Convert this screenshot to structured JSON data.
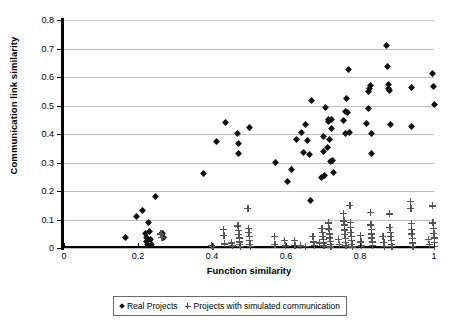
{
  "chart_data": {
    "type": "scatter",
    "title": "",
    "xlabel": "Function similarity",
    "ylabel": "Communication link similarity",
    "xlim": [
      0,
      1
    ],
    "ylim": [
      0,
      0.8
    ],
    "xticks": [
      "0",
      "0.2",
      "0.4",
      "0.6",
      "0.8",
      "1"
    ],
    "xtick_values": [
      0,
      0.2,
      0.4,
      0.6,
      0.8,
      1
    ],
    "yticks": [
      "0",
      "0.1",
      "0.2",
      "0.3",
      "0.4",
      "0.5",
      "0.6",
      "0.7",
      "0.8"
    ],
    "ytick_values": [
      0,
      0.1,
      0.2,
      0.3,
      0.4,
      0.5,
      0.6,
      0.7,
      0.8
    ],
    "grid": "horizontal",
    "legend_position": "bottom",
    "series": [
      {
        "name": "Real Projects",
        "marker": "diamond",
        "color": "#111111",
        "points": [
          [
            0.165,
            0.038
          ],
          [
            0.197,
            0.112
          ],
          [
            0.213,
            0.131
          ],
          [
            0.22,
            0.05
          ],
          [
            0.222,
            0.038
          ],
          [
            0.224,
            0.024
          ],
          [
            0.226,
            0.012
          ],
          [
            0.228,
            0.091
          ],
          [
            0.232,
            0.058
          ],
          [
            0.234,
            0.03
          ],
          [
            0.236,
            0.014
          ],
          [
            0.247,
            0.18
          ],
          [
            0.263,
            0.052
          ],
          [
            0.267,
            0.05
          ],
          [
            0.268,
            0.038
          ],
          [
            0.378,
            0.262
          ],
          [
            0.412,
            0.372
          ],
          [
            0.437,
            0.442
          ],
          [
            0.47,
            0.403
          ],
          [
            0.471,
            0.365
          ],
          [
            0.472,
            0.331
          ],
          [
            0.5,
            0.423
          ],
          [
            0.571,
            0.299
          ],
          [
            0.604,
            0.233
          ],
          [
            0.616,
            0.275
          ],
          [
            0.628,
            0.381
          ],
          [
            0.641,
            0.405
          ],
          [
            0.646,
            0.336
          ],
          [
            0.652,
            0.433
          ],
          [
            0.657,
            0.378
          ],
          [
            0.663,
            0.327
          ],
          [
            0.667,
            0.165
          ],
          [
            0.668,
            0.519
          ],
          [
            0.697,
            0.247
          ],
          [
            0.7,
            0.338
          ],
          [
            0.701,
            0.39
          ],
          [
            0.703,
            0.255
          ],
          [
            0.706,
            0.494
          ],
          [
            0.712,
            0.354
          ],
          [
            0.714,
            0.443
          ],
          [
            0.716,
            0.45
          ],
          [
            0.718,
            0.379
          ],
          [
            0.72,
            0.305
          ],
          [
            0.722,
            0.452
          ],
          [
            0.724,
            0.419
          ],
          [
            0.726,
            0.307
          ],
          [
            0.728,
            0.265
          ],
          [
            0.755,
            0.447
          ],
          [
            0.76,
            0.48
          ],
          [
            0.762,
            0.401
          ],
          [
            0.764,
            0.523
          ],
          [
            0.766,
            0.475
          ],
          [
            0.77,
            0.628
          ],
          [
            0.772,
            0.404
          ],
          [
            0.818,
            0.437
          ],
          [
            0.822,
            0.49
          ],
          [
            0.824,
            0.548
          ],
          [
            0.826,
            0.561
          ],
          [
            0.828,
            0.571
          ],
          [
            0.83,
            0.402
          ],
          [
            0.832,
            0.33
          ],
          [
            0.872,
            0.709
          ],
          [
            0.874,
            0.637
          ],
          [
            0.876,
            0.575
          ],
          [
            0.878,
            0.56
          ],
          [
            0.88,
            0.551
          ],
          [
            0.882,
            0.432
          ],
          [
            0.938,
            0.564
          ],
          [
            0.94,
            0.428
          ],
          [
            0.997,
            0.612
          ],
          [
            0.999,
            0.565
          ],
          [
            1.0,
            0.503
          ]
        ]
      },
      {
        "name": "Projects with simulated communication",
        "marker": "plus",
        "color": "#555555",
        "points": [
          [
            0.262,
            0.05
          ],
          [
            0.264,
            0.038
          ],
          [
            0.398,
            0.01
          ],
          [
            0.402,
            0.005
          ],
          [
            0.43,
            0.066
          ],
          [
            0.432,
            0.044
          ],
          [
            0.434,
            0.015
          ],
          [
            0.452,
            0.018
          ],
          [
            0.455,
            0.008
          ],
          [
            0.47,
            0.078
          ],
          [
            0.471,
            0.062
          ],
          [
            0.472,
            0.048
          ],
          [
            0.473,
            0.036
          ],
          [
            0.474,
            0.022
          ],
          [
            0.475,
            0.012
          ],
          [
            0.476,
            0.005
          ],
          [
            0.497,
            0.14
          ],
          [
            0.498,
            0.07
          ],
          [
            0.499,
            0.055
          ],
          [
            0.5,
            0.04
          ],
          [
            0.501,
            0.026
          ],
          [
            0.502,
            0.014
          ],
          [
            0.503,
            0.006
          ],
          [
            0.568,
            0.04
          ],
          [
            0.57,
            0.012
          ],
          [
            0.596,
            0.026
          ],
          [
            0.598,
            0.008
          ],
          [
            0.622,
            0.028
          ],
          [
            0.624,
            0.01
          ],
          [
            0.638,
            0.008
          ],
          [
            0.652,
            0.006
          ],
          [
            0.672,
            0.04
          ],
          [
            0.674,
            0.022
          ],
          [
            0.676,
            0.01
          ],
          [
            0.69,
            0.018
          ],
          [
            0.697,
            0.07
          ],
          [
            0.698,
            0.055
          ],
          [
            0.699,
            0.042
          ],
          [
            0.7,
            0.03
          ],
          [
            0.701,
            0.018
          ],
          [
            0.702,
            0.008
          ],
          [
            0.715,
            0.088
          ],
          [
            0.716,
            0.068
          ],
          [
            0.717,
            0.05
          ],
          [
            0.718,
            0.036
          ],
          [
            0.719,
            0.024
          ],
          [
            0.72,
            0.012
          ],
          [
            0.721,
            0.004
          ],
          [
            0.742,
            0.03
          ],
          [
            0.744,
            0.014
          ],
          [
            0.755,
            0.122
          ],
          [
            0.756,
            0.096
          ],
          [
            0.757,
            0.082
          ],
          [
            0.758,
            0.064
          ],
          [
            0.759,
            0.048
          ],
          [
            0.76,
            0.034
          ],
          [
            0.761,
            0.02
          ],
          [
            0.762,
            0.008
          ],
          [
            0.772,
            0.15
          ],
          [
            0.773,
            0.09
          ],
          [
            0.774,
            0.072
          ],
          [
            0.775,
            0.056
          ],
          [
            0.776,
            0.04
          ],
          [
            0.777,
            0.026
          ],
          [
            0.778,
            0.012
          ],
          [
            0.779,
            0.004
          ],
          [
            0.8,
            0.044
          ],
          [
            0.802,
            0.022
          ],
          [
            0.804,
            0.008
          ],
          [
            0.828,
            0.125
          ],
          [
            0.829,
            0.082
          ],
          [
            0.83,
            0.066
          ],
          [
            0.831,
            0.05
          ],
          [
            0.832,
            0.036
          ],
          [
            0.833,
            0.022
          ],
          [
            0.834,
            0.01
          ],
          [
            0.862,
            0.04
          ],
          [
            0.864,
            0.02
          ],
          [
            0.866,
            0.006
          ],
          [
            0.88,
            0.12
          ],
          [
            0.881,
            0.072
          ],
          [
            0.882,
            0.056
          ],
          [
            0.883,
            0.042
          ],
          [
            0.884,
            0.028
          ],
          [
            0.885,
            0.014
          ],
          [
            0.886,
            0.005
          ],
          [
            0.936,
            0.163
          ],
          [
            0.937,
            0.14
          ],
          [
            0.938,
            0.086
          ],
          [
            0.939,
            0.066
          ],
          [
            0.94,
            0.05
          ],
          [
            0.941,
            0.034
          ],
          [
            0.942,
            0.018
          ],
          [
            0.943,
            0.006
          ],
          [
            0.985,
            0.03
          ],
          [
            0.987,
            0.012
          ],
          [
            0.996,
            0.148
          ],
          [
            0.997,
            0.088
          ],
          [
            0.998,
            0.07
          ],
          [
            0.999,
            0.052
          ],
          [
            1.0,
            0.036
          ],
          [
            1.0,
            0.02
          ],
          [
            1.0,
            0.006
          ]
        ]
      }
    ]
  }
}
